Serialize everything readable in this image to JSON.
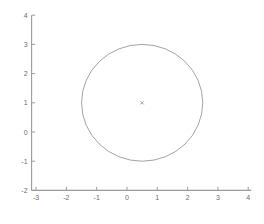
{
  "chart_data": {
    "type": "line",
    "title": "",
    "xlabel": "",
    "ylabel": "",
    "grid": false,
    "legend": null,
    "xlim": [
      -3.15,
      4.35
    ],
    "ylim": [
      -2.2,
      4.2
    ],
    "xticks": [
      "-3",
      "-2",
      "-1",
      "0",
      "1",
      "2",
      "3",
      "4"
    ],
    "xtick_values": [
      -3,
      -2,
      -1,
      0,
      1,
      2,
      3,
      4
    ],
    "yticks": [
      "4",
      "3",
      "2",
      "1",
      "0",
      "-1",
      "-2"
    ],
    "ytick_values": [
      4,
      3,
      2,
      1,
      0,
      -1,
      -2
    ],
    "series": [
      {
        "name": "circle",
        "shape": "circle",
        "center_x": 0.5,
        "center_y": 1,
        "radius": 2,
        "color": "#8c8c8c",
        "linewidth": 0.8
      },
      {
        "name": "center-marker",
        "shape": "point",
        "x": 0.5,
        "y": 1,
        "marker": "x",
        "color": "#9a9a9a"
      }
    ],
    "axis_color": "#9a9a9a",
    "tick_label_color": "#6b6b6b",
    "background": "#ffffff"
  },
  "figure": {
    "width": 264,
    "height": 224
  }
}
